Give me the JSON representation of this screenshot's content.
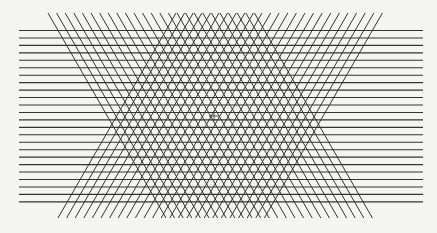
{
  "figure": {
    "background": "#f4f4f2",
    "line_color": "#333333",
    "horizontal_lines": {
      "x_start": 19,
      "x_end": 423,
      "y_first": 30.5,
      "spacing": 7.45,
      "count": 24
    },
    "diagonal_back": {
      "y_top": 13,
      "y_bottom": 218,
      "x_top_first": 48,
      "spacing": 8.6,
      "count": 25,
      "dx": 118
    },
    "diagonal_forward": {
      "y_top": 13,
      "y_bottom": 218,
      "x_top_first": 176,
      "spacing": 8.6,
      "count": 25,
      "dx": -118
    },
    "crosshair": {
      "x": 214,
      "y": 116,
      "size": 5
    }
  }
}
